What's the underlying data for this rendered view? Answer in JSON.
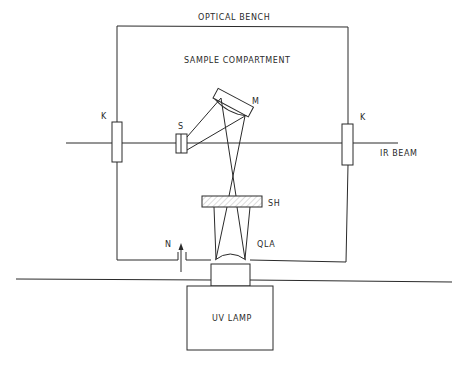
{
  "diagram": {
    "title": "OPTICAL BENCH",
    "compartment_label": "SAMPLE COMPARTMENT",
    "components": {
      "window_left": "K",
      "window_right": "K",
      "sample": "S",
      "mirror": "M",
      "shutter": "SH",
      "lens": "QLA",
      "nitrogen_inlet": "N",
      "lamp": "UV LAMP"
    },
    "beam_label": "IR BEAM",
    "colors": {
      "line": "#2a2a2a",
      "background": "#ffffff"
    }
  }
}
